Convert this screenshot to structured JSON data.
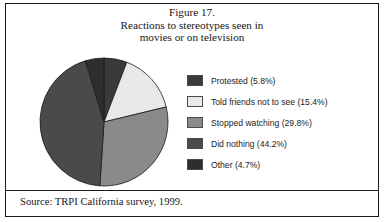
{
  "figure": {
    "title_lines": [
      "Figure 17.",
      "Reactions to stereotypes seen in",
      "movies or on television"
    ],
    "source": "Source: TRPI California survey, 1999."
  },
  "chart_data": {
    "type": "pie",
    "title": "Figure 17. Reactions to stereotypes seen in movies or on television",
    "categories": [
      "Protested",
      "Told friends not to see",
      "Stopped watching",
      "Did nothing",
      "Other"
    ],
    "values": [
      5.8,
      15.4,
      29.8,
      44.2,
      4.7
    ],
    "units": "percent",
    "legend_position": "right",
    "grid": false,
    "start_angle_deg": -90,
    "direction": "clockwise",
    "colors": [
      "#3a3a3a",
      "#e8e8e8",
      "#8a8a8a",
      "#4a4a4a",
      "#2e2e2e"
    ],
    "legend_entries": [
      "Protested (5.8%)",
      "Told friends not to see (15.4%)",
      "Stopped watching (29.8%)",
      "Did nothing (44.2%)",
      "Other (4.7%)"
    ],
    "slice_outline_color": "#1a1a1a"
  }
}
